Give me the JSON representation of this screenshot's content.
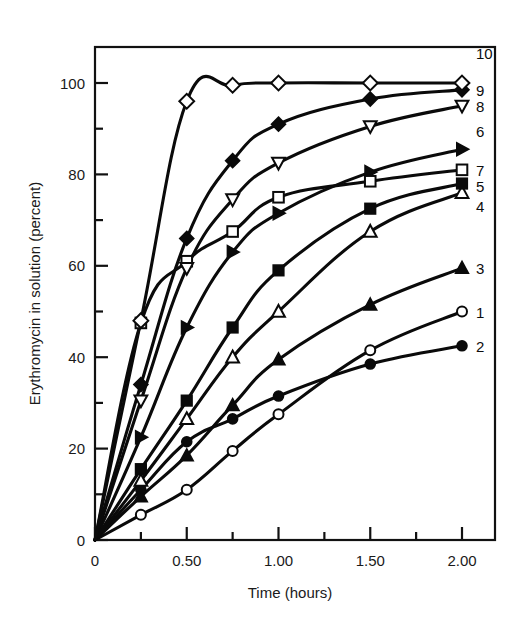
{
  "chart_data": {
    "type": "line",
    "title": "",
    "xlabel": "Time (hours)",
    "ylabel": "Erythromycin in solution (percent)",
    "xlim": [
      0,
      2.15
    ],
    "ylim": [
      0,
      108
    ],
    "xticks": [
      0,
      0.5,
      1.0,
      1.5,
      2.0
    ],
    "xticklabels": [
      "0",
      "0.50",
      "1.00",
      "1.50",
      "2.00"
    ],
    "xminorticks": [
      0.25,
      0.75,
      1.25,
      1.75
    ],
    "yticks": [
      0,
      20,
      40,
      60,
      80,
      100
    ],
    "yticklabels": [
      "0",
      "20",
      "40",
      "60",
      "80",
      "100"
    ],
    "yminorticks": [
      10,
      30,
      50,
      70,
      90
    ],
    "grid": false,
    "legend_position": "right-of-curve-ends",
    "x": [
      0,
      0.25,
      0.5,
      0.75,
      1.0,
      1.5,
      2.0
    ],
    "series": [
      {
        "name": "1",
        "label": "1",
        "marker": "open-circle",
        "values": [
          0,
          5.5,
          11.0,
          19.5,
          27.5,
          41.5,
          50.0
        ],
        "label_x": 2.0,
        "label_y": 50.0
      },
      {
        "name": "2",
        "label": "2",
        "marker": "filled-circle",
        "values": [
          0,
          11.0,
          21.5,
          26.5,
          31.5,
          38.5,
          42.5
        ],
        "label_x": 2.0,
        "label_y": 42.5
      },
      {
        "name": "3",
        "label": "3",
        "marker": "filled-triangle-up",
        "values": [
          0,
          9.5,
          18.5,
          29.5,
          39.5,
          51.5,
          59.5
        ],
        "label_x": 2.0,
        "label_y": 59.5
      },
      {
        "name": "4",
        "label": "4",
        "marker": "open-triangle-up",
        "values": [
          0,
          13.0,
          26.5,
          40.0,
          50.0,
          67.5,
          76.0
        ],
        "label_x": 2.0,
        "label_y": 73.0
      },
      {
        "name": "5",
        "label": "5",
        "marker": "filled-square",
        "values": [
          0,
          15.5,
          30.5,
          46.5,
          59.0,
          72.5,
          78.0
        ],
        "label_x": 2.0,
        "label_y": 77.5
      },
      {
        "name": "6",
        "label": "6",
        "marker": "filled-triangle-right",
        "values": [
          0,
          22.5,
          46.5,
          63.0,
          71.5,
          80.5,
          85.5
        ],
        "label_x": 2.0,
        "label_y": 89.5
      },
      {
        "name": "7",
        "label": "7",
        "marker": "open-square",
        "values": [
          0,
          47.5,
          61.0,
          67.5,
          75.0,
          78.5,
          81.0
        ],
        "label_x": 2.0,
        "label_y": 81.0
      },
      {
        "name": "8",
        "label": "8",
        "marker": "open-triangle-down",
        "values": [
          0,
          30.5,
          59.5,
          74.5,
          82.5,
          90.5,
          95.0
        ],
        "label_x": 2.0,
        "label_y": 95.0
      },
      {
        "name": "9",
        "label": "9",
        "marker": "filled-diamond",
        "values": [
          0,
          34.0,
          66.0,
          83.0,
          91.0,
          96.5,
          98.5
        ],
        "label_x": 2.0,
        "label_y": 98.5
      },
      {
        "name": "10",
        "label": "10",
        "marker": "open-diamond",
        "values": [
          0,
          48.0,
          96.0,
          99.5,
          100.0,
          100.0,
          100.0
        ],
        "label_x": 2.0,
        "label_y": 106.5
      }
    ]
  },
  "axes": {
    "x_title": "Time (hours)",
    "y_title": "Erythromycin in solution (percent)"
  }
}
